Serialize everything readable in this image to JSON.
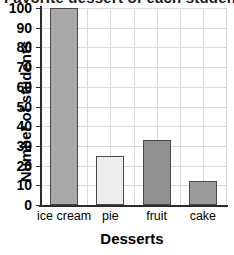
{
  "chart_data": {
    "type": "bar",
    "title": "Favorite dessert of each student",
    "xlabel": "Desserts",
    "ylabel": "Number of students",
    "categories": [
      "ice cream",
      "pie",
      "fruit",
      "cake"
    ],
    "values": [
      100,
      25,
      33,
      12
    ],
    "ylim": [
      0,
      100
    ],
    "ytick_labels": [
      "100",
      "90",
      "80",
      "70",
      "60",
      "50",
      "40",
      "30",
      "20",
      "10",
      "0"
    ],
    "ytick_values": [
      100,
      90,
      80,
      70,
      60,
      50,
      40,
      30,
      20,
      10,
      0
    ],
    "ystep": 10,
    "grid": true,
    "legend": "none",
    "bar_colors": [
      "#a9a9a9",
      "#ededed",
      "#909090",
      "#9b9b9b"
    ],
    "bar_edge_color": "#4a4a4a",
    "axis_color": "#2b2b2b",
    "grid_color": "#d8d8d8",
    "background": "#ffffff"
  }
}
